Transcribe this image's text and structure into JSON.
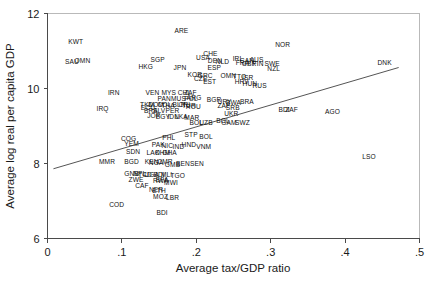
{
  "chart_data": {
    "type": "scatter",
    "title": "",
    "xlabel": "Average tax/GDP ratio",
    "ylabel": "Average log real per capita GDP",
    "xlim": [
      0,
      0.5
    ],
    "ylim": [
      6,
      12
    ],
    "xticks": [
      "0",
      ".1",
      ".2",
      ".3",
      ".4",
      ".5"
    ],
    "xtick_values": [
      0,
      0.1,
      0.2,
      0.3,
      0.4,
      0.5
    ],
    "yticks": [
      "6",
      "8",
      "10",
      "12"
    ],
    "ytick_values": [
      6,
      8,
      10,
      12
    ],
    "grid": false,
    "legend": null,
    "marker": "text-label",
    "fit_line": {
      "type": "linear",
      "x_start": 0.008,
      "y_start": 7.86,
      "x_end": 0.472,
      "y_end": 10.56
    },
    "points": [
      {
        "label": "KWT",
        "x": 0.038,
        "y": 11.25
      },
      {
        "label": "SAU",
        "x": 0.033,
        "y": 10.72
      },
      {
        "label": "OMN",
        "x": 0.047,
        "y": 10.73
      },
      {
        "label": "ARE",
        "x": 0.18,
        "y": 11.55
      },
      {
        "label": "SGP",
        "x": 0.148,
        "y": 10.78
      },
      {
        "label": "HKG",
        "x": 0.132,
        "y": 10.58
      },
      {
        "label": "JPN",
        "x": 0.178,
        "y": 10.56
      },
      {
        "label": "CHE",
        "x": 0.219,
        "y": 10.92
      },
      {
        "label": "USA",
        "x": 0.209,
        "y": 10.81
      },
      {
        "label": "DEN",
        "x": 0.225,
        "y": 10.73
      },
      {
        "label": "NLD",
        "x": 0.235,
        "y": 10.72
      },
      {
        "label": "IRL",
        "x": 0.256,
        "y": 10.79
      },
      {
        "label": "NOR",
        "x": 0.316,
        "y": 11.18
      },
      {
        "label": "DNK",
        "x": 0.453,
        "y": 10.68
      },
      {
        "label": "ESP",
        "x": 0.224,
        "y": 10.56
      },
      {
        "label": "KOR",
        "x": 0.198,
        "y": 10.36
      },
      {
        "label": "GRC",
        "x": 0.212,
        "y": 10.35
      },
      {
        "label": "CZE",
        "x": 0.206,
        "y": 10.25
      },
      {
        "label": "EST",
        "x": 0.218,
        "y": 10.18
      },
      {
        "label": "OMN2",
        "x": 0.243,
        "y": 10.33
      },
      {
        "label": "TTO",
        "x": 0.258,
        "y": 10.32
      },
      {
        "label": "ISR",
        "x": 0.269,
        "y": 10.3
      },
      {
        "label": "CAN",
        "x": 0.268,
        "y": 10.74
      },
      {
        "label": "AUS",
        "x": 0.281,
        "y": 10.76
      },
      {
        "label": "FRA",
        "x": 0.262,
        "y": 10.68
      },
      {
        "label": "GBR",
        "x": 0.271,
        "y": 10.67
      },
      {
        "label": "FIN",
        "x": 0.283,
        "y": 10.67
      },
      {
        "label": "SWE",
        "x": 0.302,
        "y": 10.66
      },
      {
        "label": "NZL",
        "x": 0.304,
        "y": 10.54
      },
      {
        "label": "HRV",
        "x": 0.261,
        "y": 10.19
      },
      {
        "label": "HUN",
        "x": 0.272,
        "y": 10.14
      },
      {
        "label": "RUS",
        "x": 0.285,
        "y": 10.08
      },
      {
        "label": "IRN",
        "x": 0.089,
        "y": 9.88
      },
      {
        "label": "VEN",
        "x": 0.141,
        "y": 9.88
      },
      {
        "label": "MYS",
        "x": 0.163,
        "y": 9.88
      },
      {
        "label": "CHL",
        "x": 0.184,
        "y": 9.9
      },
      {
        "label": "ZAF",
        "x": 0.192,
        "y": 9.88
      },
      {
        "label": "PAN",
        "x": 0.157,
        "y": 9.72
      },
      {
        "label": "MUS",
        "x": 0.176,
        "y": 9.72
      },
      {
        "label": "POL",
        "x": 0.193,
        "y": 9.74
      },
      {
        "label": "ARG",
        "x": 0.197,
        "y": 9.76
      },
      {
        "label": "BGR",
        "x": 0.224,
        "y": 9.7
      },
      {
        "label": "URY",
        "x": 0.238,
        "y": 9.66
      },
      {
        "label": "BWA",
        "x": 0.25,
        "y": 9.62
      },
      {
        "label": "BRA",
        "x": 0.268,
        "y": 9.64
      },
      {
        "label": "IRQ",
        "x": 0.074,
        "y": 9.47
      },
      {
        "label": "TKM",
        "x": 0.134,
        "y": 9.58
      },
      {
        "label": "DOM",
        "x": 0.146,
        "y": 9.57
      },
      {
        "label": "ECU",
        "x": 0.135,
        "y": 9.48
      },
      {
        "label": "COL",
        "x": 0.157,
        "y": 9.58
      },
      {
        "label": "THA",
        "x": 0.162,
        "y": 9.54
      },
      {
        "label": "BLR",
        "x": 0.177,
        "y": 9.56
      },
      {
        "label": "CRI",
        "x": 0.184,
        "y": 9.57
      },
      {
        "label": "TUR",
        "x": 0.19,
        "y": 9.54
      },
      {
        "label": "ROU",
        "x": 0.196,
        "y": 9.52
      },
      {
        "label": "ZAF2",
        "x": 0.237,
        "y": 9.53
      },
      {
        "label": "SRB",
        "x": 0.249,
        "y": 9.48
      },
      {
        "label": "BDI2",
        "x": 0.318,
        "y": 9.43
      },
      {
        "label": "ZAF3",
        "x": 0.328,
        "y": 9.44
      },
      {
        "label": "AGO",
        "x": 0.383,
        "y": 9.37
      },
      {
        "label": "BRA2",
        "x": 0.139,
        "y": 9.4
      },
      {
        "label": "SLV",
        "x": 0.15,
        "y": 9.4
      },
      {
        "label": "PER",
        "x": 0.168,
        "y": 9.4
      },
      {
        "label": "UKR",
        "x": 0.247,
        "y": 9.33
      },
      {
        "label": "JOR",
        "x": 0.143,
        "y": 9.28
      },
      {
        "label": "EGY",
        "x": 0.155,
        "y": 9.26
      },
      {
        "label": "IDN",
        "x": 0.169,
        "y": 9.26
      },
      {
        "label": "LKA",
        "x": 0.18,
        "y": 9.26
      },
      {
        "label": "MAR",
        "x": 0.194,
        "y": 9.22
      },
      {
        "label": "BOL",
        "x": 0.2,
        "y": 9.1
      },
      {
        "label": "UZB",
        "x": 0.213,
        "y": 9.08
      },
      {
        "label": "BOL2",
        "x": 0.236,
        "y": 9.14
      },
      {
        "label": "GAM",
        "x": 0.244,
        "y": 9.1
      },
      {
        "label": "SWZ",
        "x": 0.262,
        "y": 9.1
      },
      {
        "label": "COG",
        "x": 0.109,
        "y": 8.66
      },
      {
        "label": "PHL",
        "x": 0.163,
        "y": 8.7
      },
      {
        "label": "STP",
        "x": 0.193,
        "y": 8.76
      },
      {
        "label": "BOL3",
        "x": 0.213,
        "y": 8.72
      },
      {
        "label": "YEM",
        "x": 0.113,
        "y": 8.52
      },
      {
        "label": "PAK",
        "x": 0.149,
        "y": 8.5
      },
      {
        "label": "NIC",
        "x": 0.161,
        "y": 8.48
      },
      {
        "label": "HND",
        "x": 0.19,
        "y": 8.5
      },
      {
        "label": "IND",
        "x": 0.176,
        "y": 8.44
      },
      {
        "label": "VNM",
        "x": 0.21,
        "y": 8.46
      },
      {
        "label": "SDN",
        "x": 0.115,
        "y": 8.32
      },
      {
        "label": "LAO",
        "x": 0.142,
        "y": 8.3
      },
      {
        "label": "KHM",
        "x": 0.155,
        "y": 8.28
      },
      {
        "label": "GHA",
        "x": 0.164,
        "y": 8.28
      },
      {
        "label": "MMR",
        "x": 0.08,
        "y": 8.05
      },
      {
        "label": "BGD",
        "x": 0.113,
        "y": 8.05
      },
      {
        "label": "KEN",
        "x": 0.14,
        "y": 8.04
      },
      {
        "label": "NGA",
        "x": 0.146,
        "y": 8.02
      },
      {
        "label": "CMR",
        "x": 0.158,
        "y": 8.06
      },
      {
        "label": "GMB",
        "x": 0.168,
        "y": 7.98
      },
      {
        "label": "BEN",
        "x": 0.182,
        "y": 8.0
      },
      {
        "label": "SEN",
        "x": 0.201,
        "y": 8.0
      },
      {
        "label": "GNB",
        "x": 0.113,
        "y": 7.72
      },
      {
        "label": "NPL",
        "x": 0.124,
        "y": 7.72
      },
      {
        "label": "TCD",
        "x": 0.131,
        "y": 7.7
      },
      {
        "label": "UGA",
        "x": 0.14,
        "y": 7.7
      },
      {
        "label": "BDI3",
        "x": 0.15,
        "y": 7.7
      },
      {
        "label": "MLI",
        "x": 0.16,
        "y": 7.7
      },
      {
        "label": "TGO",
        "x": 0.175,
        "y": 7.68
      },
      {
        "label": "ZWE",
        "x": 0.119,
        "y": 7.58
      },
      {
        "label": "RWA",
        "x": 0.152,
        "y": 7.54
      },
      {
        "label": "MWI",
        "x": 0.166,
        "y": 7.5
      },
      {
        "label": "BFA",
        "x": 0.154,
        "y": 7.56
      },
      {
        "label": "CAF",
        "x": 0.127,
        "y": 7.42
      },
      {
        "label": "NER",
        "x": 0.146,
        "y": 7.3
      },
      {
        "label": "ETH",
        "x": 0.15,
        "y": 7.28
      },
      {
        "label": "MOZ",
        "x": 0.152,
        "y": 7.12
      },
      {
        "label": "LBR",
        "x": 0.168,
        "y": 7.08
      },
      {
        "label": "COD",
        "x": 0.093,
        "y": 6.9
      },
      {
        "label": "BDI",
        "x": 0.154,
        "y": 6.7
      },
      {
        "label": "LSO",
        "x": 0.432,
        "y": 8.18
      }
    ]
  },
  "labels": {
    "x_axis_title": "Average tax/GDP ratio",
    "y_axis_title": "Average log real per capita GDP"
  }
}
